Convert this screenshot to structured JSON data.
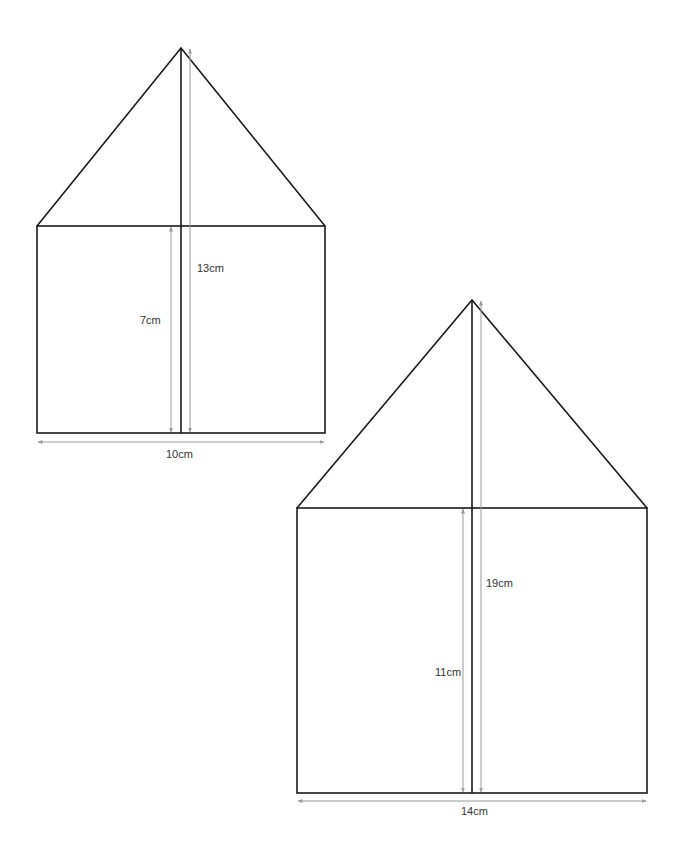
{
  "diagram": {
    "colors": {
      "outline": "#1a1a1a",
      "dimension": "#9a9a9a",
      "text": "#333333",
      "background": "#ffffff"
    },
    "shapes": [
      {
        "id": "small-house",
        "labels": {
          "total_height": "13cm",
          "wall_height": "7cm",
          "width": "10cm"
        },
        "geometry": {
          "left": 37,
          "right": 325,
          "apex_x": 181,
          "apex_y": 48,
          "eave_y": 226,
          "base_y": 433
        }
      },
      {
        "id": "large-house",
        "labels": {
          "total_height": "19cm",
          "wall_height": "11cm",
          "width": "14cm"
        },
        "geometry": {
          "left": 297,
          "right": 647,
          "apex_x": 472,
          "apex_y": 300,
          "eave_y": 508,
          "base_y": 793
        }
      }
    ]
  }
}
